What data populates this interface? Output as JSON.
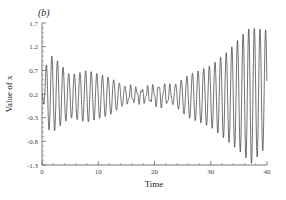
{
  "panel_label": "(b)",
  "chart_data": {
    "type": "line",
    "title": "",
    "panel_label": "(b)",
    "xlabel": "Time",
    "ylabel": "Value of x",
    "xlim": [
      0,
      40
    ],
    "ylim": [
      -1.3,
      1.7
    ],
    "xticks": [
      0,
      10,
      20,
      30,
      40
    ],
    "xtick_labels": [
      "0",
      "10",
      "20",
      "30",
      "40"
    ],
    "yticks": [
      -1.3,
      -0.8,
      -0.3,
      0.2,
      0.7,
      1.2,
      1.7
    ],
    "ytick_labels": [
      "-1.3",
      "-0.8",
      "-0.3",
      "0.2",
      "0.7",
      "1.2",
      "1.7"
    ],
    "grid": false,
    "legend": null,
    "series": [
      {
        "name": "x(t)",
        "description": "oscillatory signal, ~1 cycle per time unit; amplitude moderate at start, decays to a minimum around t=15-23, then grows strongly to t=40",
        "envelope": {
          "t": [
            0,
            1,
            2,
            5,
            8,
            12,
            15,
            18,
            21,
            23,
            26,
            30,
            33,
            36,
            37,
            40
          ],
          "upper": [
            0.2,
            1.0,
            1.0,
            0.6,
            0.7,
            0.55,
            0.35,
            0.3,
            0.4,
            0.35,
            0.6,
            0.8,
            1.1,
            1.5,
            1.6,
            1.55
          ],
          "lower": [
            0.2,
            -0.55,
            -0.6,
            -0.3,
            -0.4,
            -0.25,
            0.0,
            0.05,
            -0.05,
            0.0,
            -0.3,
            -0.5,
            -0.8,
            -1.1,
            -1.3,
            -0.9
          ]
        },
        "period": 1.0
      }
    ]
  }
}
